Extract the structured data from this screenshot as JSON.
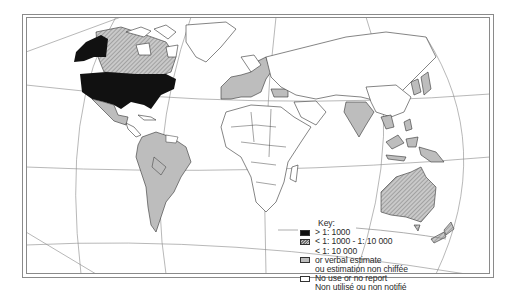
{
  "map": {
    "projection_grid": true,
    "colors": {
      "black_category": "#111111",
      "hatched_category": "#aaaaaa",
      "grey_category": "#bdbdbd",
      "none_category": "#ffffff",
      "outline": "#333333",
      "grid": "#777777"
    }
  },
  "legend": {
    "title": "Key:",
    "items": [
      {
        "swatch": "black",
        "label": "> 1: 1000"
      },
      {
        "swatch": "hatched",
        "label": "< 1: 1000 - 1: 10 000"
      },
      {
        "swatch": "grey",
        "label": "< 1: 10 000",
        "label2": "or verbal estimate",
        "label3": "ou estimation non chiffée"
      },
      {
        "swatch": "white",
        "label": "No use or no report",
        "label2": "Non utilisé ou non notifié"
      }
    ]
  }
}
